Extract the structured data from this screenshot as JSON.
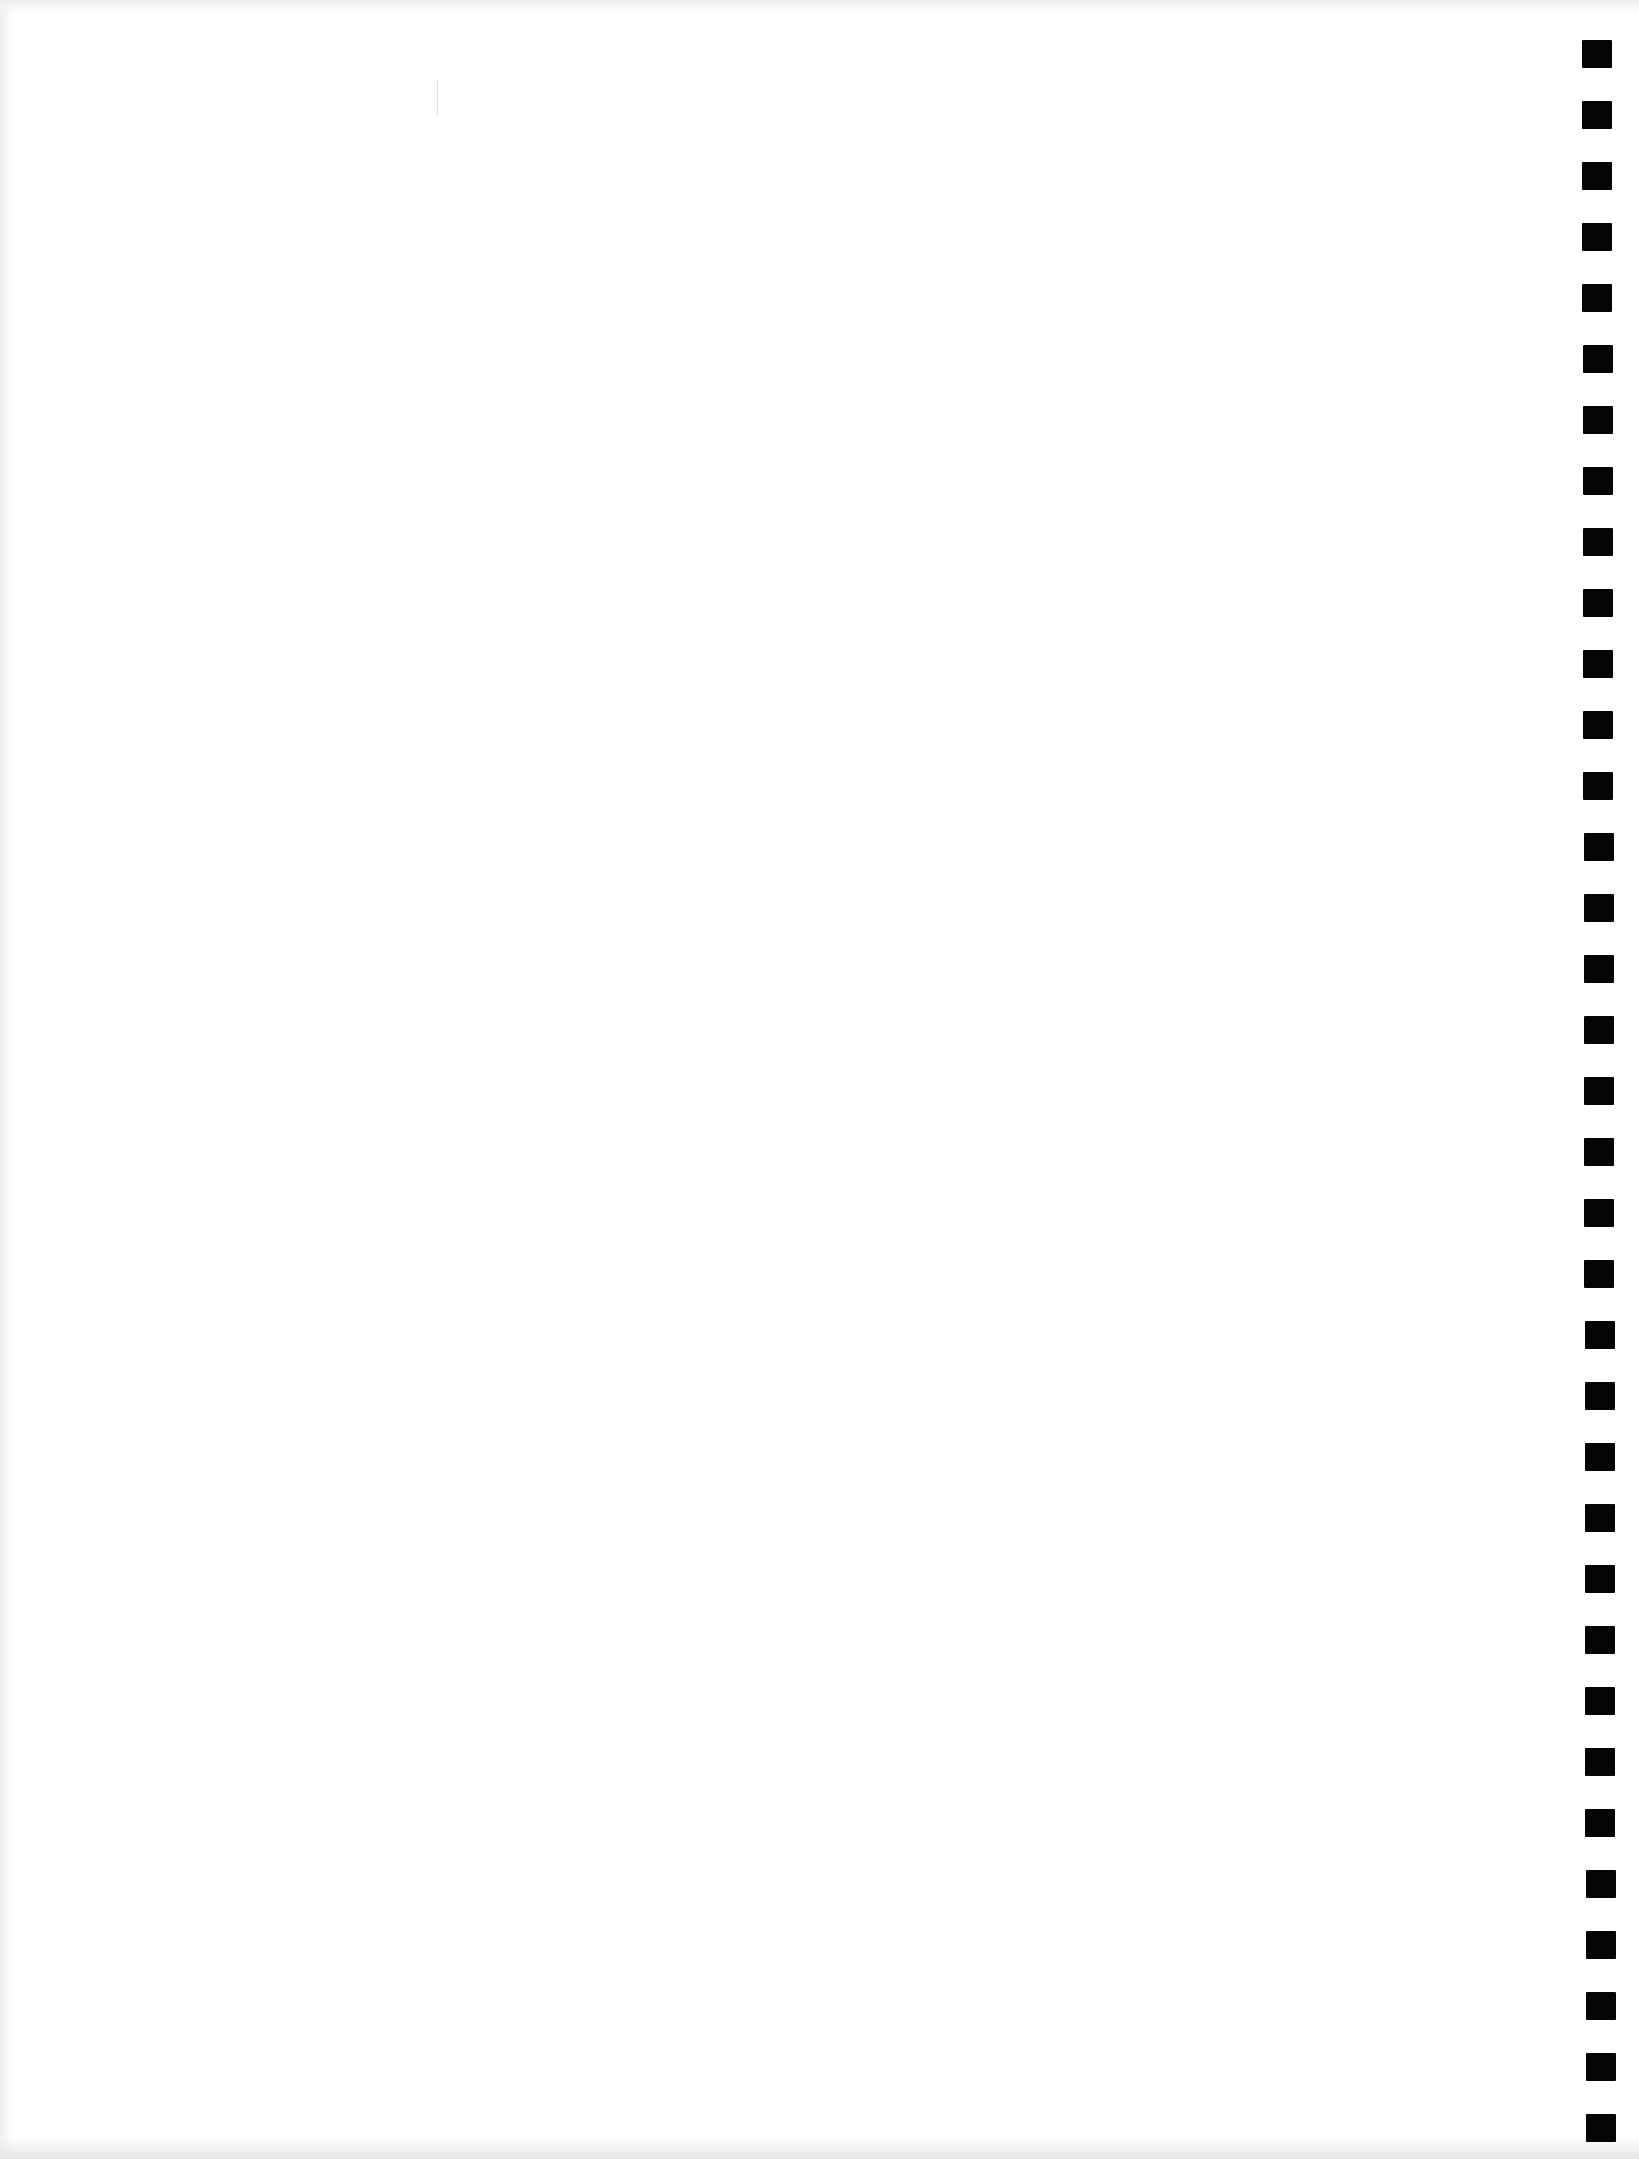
{
  "page": {
    "type": "blank scanned form page",
    "width": 1639,
    "height": 2159,
    "background": "#ffffff",
    "text_content": []
  },
  "timing_marks": {
    "count": 35,
    "color": "#050505",
    "first_top": 40,
    "pitch": 61,
    "mark_width": 30,
    "mark_height": 28,
    "left": 1582
  }
}
